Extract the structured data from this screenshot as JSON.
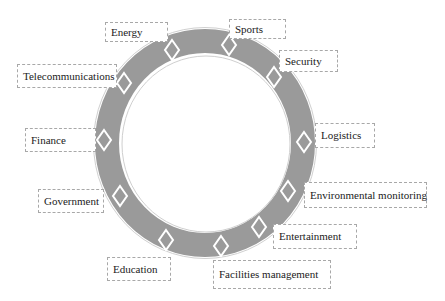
{
  "diagram": {
    "type": "circular-ring",
    "ring": {
      "cx": 205,
      "cy": 143,
      "rx": 110,
      "ry": 114,
      "thickness": 24,
      "fill": "#9a9a9a",
      "edge": "#d0d0d0"
    },
    "colors": {
      "ring": "#9a9a9a",
      "diamond_fill": "#9a9a9a",
      "diamond_stroke": "#ffffff",
      "label_border": "#a8a8a8",
      "text": "#222222"
    },
    "items": [
      {
        "label": "Energy",
        "box": [
          105,
          22,
          63,
          20
        ],
        "diamond": [
          172,
          50
        ],
        "rot": 0
      },
      {
        "label": "Sports",
        "box": [
          229,
          19,
          57,
          20
        ],
        "diamond": [
          229,
          45
        ],
        "rot": 0
      },
      {
        "label": "Security",
        "box": [
          279,
          50,
          59,
          22
        ],
        "diamond": [
          274,
          77
        ],
        "rot": 0
      },
      {
        "label": "Telecommunications",
        "box": [
          17,
          64,
          100,
          24
        ],
        "diamond": [
          124,
          83
        ],
        "rot": 0
      },
      {
        "label": "Logistics",
        "box": [
          315,
          123,
          60,
          25
        ],
        "diamond": [
          304,
          142
        ],
        "rot": 0
      },
      {
        "label": "Finance",
        "box": [
          25,
          128,
          71,
          24
        ],
        "diamond": [
          104,
          140
        ],
        "rot": 0
      },
      {
        "label": "Environmental monitoring",
        "box": [
          304,
          182,
          123,
          26
        ],
        "diamond": [
          288,
          191
        ],
        "rot": 0
      },
      {
        "label": "Government",
        "box": [
          38,
          189,
          66,
          24
        ],
        "diamond": [
          120,
          196
        ],
        "rot": 0
      },
      {
        "label": "Entertainment",
        "box": [
          273,
          224,
          84,
          25
        ],
        "diamond": [
          259,
          227
        ],
        "rot": 0
      },
      {
        "label": "Education",
        "box": [
          107,
          257,
          64,
          24
        ],
        "diamond": [
          166,
          240
        ],
        "rot": 0
      },
      {
        "label": "Facilities management",
        "box": [
          213,
          260,
          118,
          29
        ],
        "diamond": [
          221,
          246
        ],
        "rot": 0
      }
    ]
  }
}
